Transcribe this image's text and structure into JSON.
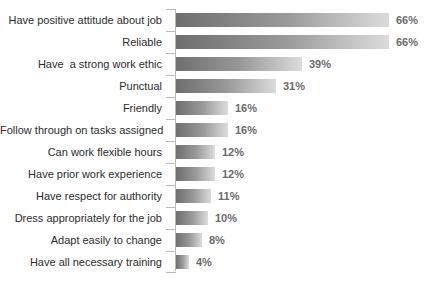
{
  "chart_data": {
    "type": "bar",
    "orientation": "horizontal",
    "title": "",
    "subtitle": "",
    "xlabel": "",
    "ylabel": "",
    "xlim": [
      0,
      70
    ],
    "grid": false,
    "legend": null,
    "value_suffix": "%",
    "categories": [
      "Have positive attitude about job",
      "Reliable",
      "Have  a strong work ethic",
      "Punctual",
      "Friendly",
      "Follow through on tasks assigned",
      "Can work flexible hours",
      "Have prior work experience",
      "Have respect for authority",
      "Dress appropriately for the job",
      "Adapt easily to change",
      "Have all necessary training"
    ],
    "values": [
      66,
      66,
      39,
      31,
      16,
      16,
      12,
      12,
      11,
      10,
      8,
      4
    ],
    "value_labels": [
      "66%",
      "66%",
      "39%",
      "31%",
      "16%",
      "16%",
      "12%",
      "12%",
      "11%",
      "10%",
      "8%",
      "4%"
    ],
    "colors": {
      "bar_gradient_start": "#6f6f6f",
      "bar_gradient_end": "#dcdcdc",
      "category_label": "#2c2c2c",
      "value_label": "#6b6b6b",
      "axis_line": "#b9b9b9",
      "background": "#ffffff"
    }
  },
  "title_remnant": ""
}
